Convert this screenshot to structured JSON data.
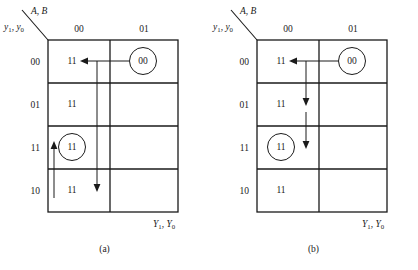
{
  "figure": {
    "title_implicit": "",
    "background_color": "#ffffff",
    "line_color": "#1a1a1a"
  },
  "diagrams": [
    {
      "id": "a",
      "caption": "(a)",
      "column_axis_label": {
        "main": "A",
        "sep": ", ",
        "second": "B"
      },
      "row_axis_label": {
        "var1": "y",
        "sub1": "1",
        "sep": ", ",
        "var2": "y",
        "sub2": "0"
      },
      "output_label": {
        "var1": "Y",
        "sub1": "1",
        "sep": ", ",
        "var2": "Y",
        "sub2": "0"
      },
      "column_headers": [
        "00",
        "01"
      ],
      "row_headers": [
        "00",
        "01",
        "11",
        "10"
      ],
      "cells": [
        [
          {
            "value": "11",
            "circled": false
          },
          {
            "value": "00",
            "circled": true
          }
        ],
        [
          {
            "value": "11",
            "circled": false
          },
          {
            "value": "",
            "circled": false
          }
        ],
        [
          {
            "value": "11",
            "circled": true
          },
          {
            "value": "",
            "circled": false
          }
        ],
        [
          {
            "value": "11",
            "circled": false
          },
          {
            "value": "",
            "circled": false
          }
        ]
      ],
      "arrows": [
        {
          "name": "horizontal-arrow-row00",
          "direction": "left",
          "from_cell": "r0c1",
          "to_cell": "r0c0"
        },
        {
          "name": "vertical-arrow-down-to-row10",
          "direction": "down",
          "from_row": "00",
          "to_row": "10"
        },
        {
          "name": "vertical-arrow-up-to-row11",
          "direction": "up",
          "from_row": "10",
          "to_row": "11"
        }
      ]
    },
    {
      "id": "b",
      "caption": "(b)",
      "column_axis_label": {
        "main": "A",
        "sep": ", ",
        "second": "B"
      },
      "row_axis_label": {
        "var1": "y",
        "sub1": "1",
        "sep": ", ",
        "var2": "y",
        "sub2": "0"
      },
      "output_label": {
        "var1": "Y",
        "sub1": "1",
        "sep": ", ",
        "var2": "Y",
        "sub2": "0"
      },
      "column_headers": [
        "00",
        "01"
      ],
      "row_headers": [
        "00",
        "01",
        "11",
        "10"
      ],
      "cells": [
        [
          {
            "value": "11",
            "circled": false
          },
          {
            "value": "00",
            "circled": true
          }
        ],
        [
          {
            "value": "11",
            "circled": false
          },
          {
            "value": "",
            "circled": false
          }
        ],
        [
          {
            "value": "11",
            "circled": true
          },
          {
            "value": "",
            "circled": false
          }
        ],
        [
          {
            "value": "11",
            "circled": false
          },
          {
            "value": "",
            "circled": false
          }
        ]
      ],
      "arrows": [
        {
          "name": "horizontal-arrow-row00",
          "direction": "left",
          "from_cell": "r0c1",
          "to_cell": "r0c0"
        },
        {
          "name": "vertical-arrow-down-to-row01",
          "direction": "down",
          "from_row": "00",
          "to_row": "01"
        },
        {
          "name": "vertical-arrow-down-to-row11",
          "direction": "down",
          "from_row": "01",
          "to_row": "11"
        }
      ]
    }
  ]
}
